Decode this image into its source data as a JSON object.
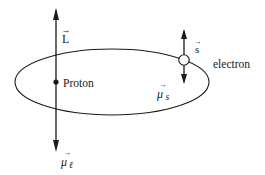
{
  "diagram": {
    "type": "spin-orbit coupling schematic",
    "stroke_color": "#1a1a1a",
    "background_color": "#ffffff",
    "labels": {
      "orbital_angular_momentum": "L",
      "proton": "Proton",
      "spin": "s",
      "electron": "electron",
      "spin_magnetic_moment": "μ",
      "spin_magnetic_moment_sub": "s",
      "orbital_magnetic_moment": "μ",
      "orbital_magnetic_moment_sub": "ℓ"
    },
    "vector_arrow_glyph": "→"
  }
}
